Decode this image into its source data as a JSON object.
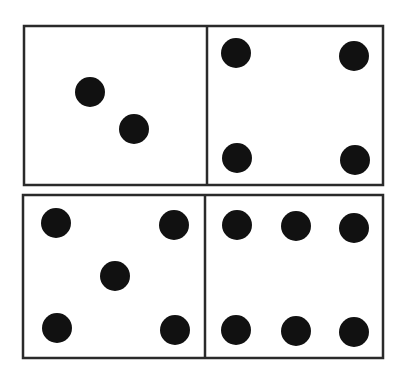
{
  "dominoes": [
    {
      "name": "domino-top",
      "box": {
        "x": 24,
        "y": 26,
        "w": 359,
        "h": 159
      },
      "divider_x": 207,
      "halves": [
        {
          "value": 2,
          "pips": [
            [
              90,
              92
            ],
            [
              134,
              129
            ]
          ]
        },
        {
          "value": 4,
          "pips": [
            [
              236,
              53
            ],
            [
              354,
              56
            ],
            [
              237,
              158
            ],
            [
              355,
              160
            ]
          ]
        }
      ]
    },
    {
      "name": "domino-bottom",
      "box": {
        "x": 23,
        "y": 195,
        "w": 360,
        "h": 163
      },
      "divider_x": 205,
      "halves": [
        {
          "value": 5,
          "pips": [
            [
              56,
              223
            ],
            [
              174,
              225
            ],
            [
              115,
              276
            ],
            [
              57,
              328
            ],
            [
              175,
              330
            ]
          ]
        },
        {
          "value": 6,
          "pips": [
            [
              237,
              225
            ],
            [
              296,
              226
            ],
            [
              354,
              228
            ],
            [
              236,
              330
            ],
            [
              296,
              331
            ],
            [
              354,
              332
            ]
          ]
        }
      ]
    }
  ],
  "style": {
    "stroke": "#2a2a2a",
    "pip_color": "#111111",
    "pip_radius": 15,
    "stroke_width": 2.5
  }
}
